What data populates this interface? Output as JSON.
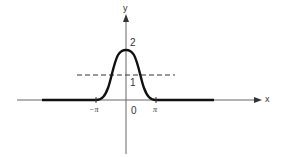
{
  "diagram": {
    "type": "function-graph",
    "function": "f(x) = 1 + cos(x) for |x| <= pi, 0 otherwise",
    "axes": {
      "x_label": "x",
      "y_label": "y"
    },
    "labels": {
      "y_two": "2",
      "y_one": "1",
      "origin": "0",
      "neg_pi": "−π",
      "pos_pi": "π"
    },
    "dashed_line": {
      "y_value": 1,
      "style": "dashed"
    },
    "colors": {
      "curve": "#111111",
      "axis": "#555555",
      "text": "#333333"
    }
  }
}
